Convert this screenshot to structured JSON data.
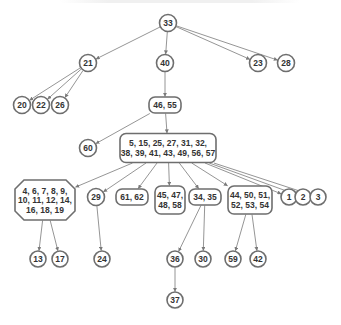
{
  "diagram": {
    "title": "",
    "type": "tree",
    "root": "n33",
    "nodes": [
      {
        "id": "n33",
        "label": [
          "33"
        ],
        "shape": "circle",
        "level": 0
      },
      {
        "id": "n21",
        "label": [
          "21"
        ],
        "shape": "circle",
        "level": 1
      },
      {
        "id": "n40",
        "label": [
          "40"
        ],
        "shape": "circle",
        "level": 1
      },
      {
        "id": "n23",
        "label": [
          "23"
        ],
        "shape": "circle",
        "level": 1
      },
      {
        "id": "n28",
        "label": [
          "28"
        ],
        "shape": "circle",
        "level": 1
      },
      {
        "id": "n20",
        "label": [
          "20"
        ],
        "shape": "circle",
        "level": 2
      },
      {
        "id": "n22",
        "label": [
          "22"
        ],
        "shape": "circle",
        "level": 2
      },
      {
        "id": "n26",
        "label": [
          "26"
        ],
        "shape": "circle",
        "level": 2
      },
      {
        "id": "n46_55",
        "label": [
          "46, 55"
        ],
        "shape": "rounded",
        "level": 2
      },
      {
        "id": "n60",
        "label": [
          "60"
        ],
        "shape": "circle",
        "level": 3
      },
      {
        "id": "nbig",
        "label": [
          "5, 15, 25, 27, 31, 32,",
          "38, 39, 41, 43, 49, 56, 57"
        ],
        "shape": "rounded",
        "level": 3
      },
      {
        "id": "noct",
        "label": [
          "4, 6, 7, 8, 9,",
          "10, 11, 12, 14,",
          "16, 18, 19"
        ],
        "shape": "octagon",
        "level": 4
      },
      {
        "id": "n29",
        "label": [
          "29"
        ],
        "shape": "circle",
        "level": 4
      },
      {
        "id": "n61_62",
        "label": [
          "61, 62"
        ],
        "shape": "rounded",
        "level": 4
      },
      {
        "id": "n45_58",
        "label": [
          "45, 47,",
          "48, 58"
        ],
        "shape": "rounded",
        "level": 4
      },
      {
        "id": "n34_35",
        "label": [
          "34, 35"
        ],
        "shape": "rounded",
        "level": 4
      },
      {
        "id": "n44_54",
        "label": [
          "44, 50, 51,",
          "52, 53, 54"
        ],
        "shape": "rounded",
        "level": 4
      },
      {
        "id": "n1",
        "label": [
          "1"
        ],
        "shape": "circle",
        "level": 4
      },
      {
        "id": "n2",
        "label": [
          "2"
        ],
        "shape": "circle",
        "level": 4
      },
      {
        "id": "n3",
        "label": [
          "3"
        ],
        "shape": "circle",
        "level": 4
      },
      {
        "id": "n13",
        "label": [
          "13"
        ],
        "shape": "circle",
        "level": 5
      },
      {
        "id": "n17",
        "label": [
          "17"
        ],
        "shape": "circle",
        "level": 5
      },
      {
        "id": "n24",
        "label": [
          "24"
        ],
        "shape": "circle",
        "level": 5
      },
      {
        "id": "n36",
        "label": [
          "36"
        ],
        "shape": "circle",
        "level": 5
      },
      {
        "id": "n30",
        "label": [
          "30"
        ],
        "shape": "circle",
        "level": 5
      },
      {
        "id": "n59",
        "label": [
          "59"
        ],
        "shape": "circle",
        "level": 5
      },
      {
        "id": "n42",
        "label": [
          "42"
        ],
        "shape": "circle",
        "level": 5
      },
      {
        "id": "n37",
        "label": [
          "37"
        ],
        "shape": "circle",
        "level": 6
      }
    ],
    "edges": [
      [
        "n33",
        "n21"
      ],
      [
        "n33",
        "n40"
      ],
      [
        "n33",
        "n23"
      ],
      [
        "n33",
        "n28"
      ],
      [
        "n21",
        "n20"
      ],
      [
        "n21",
        "n22"
      ],
      [
        "n21",
        "n26"
      ],
      [
        "n40",
        "n46_55"
      ],
      [
        "n46_55",
        "n60"
      ],
      [
        "n46_55",
        "nbig"
      ],
      [
        "nbig",
        "noct"
      ],
      [
        "nbig",
        "n29"
      ],
      [
        "nbig",
        "n61_62"
      ],
      [
        "nbig",
        "n45_58"
      ],
      [
        "nbig",
        "n34_35"
      ],
      [
        "nbig",
        "n44_54"
      ],
      [
        "nbig",
        "n1"
      ],
      [
        "nbig",
        "n2"
      ],
      [
        "nbig",
        "n3"
      ],
      [
        "noct",
        "n13"
      ],
      [
        "noct",
        "n17"
      ],
      [
        "n29",
        "n24"
      ],
      [
        "n34_35",
        "n36"
      ],
      [
        "n34_35",
        "n30"
      ],
      [
        "n44_54",
        "n59"
      ],
      [
        "n44_54",
        "n42"
      ],
      [
        "n36",
        "n37"
      ]
    ],
    "colors": {
      "node_stroke": "#6e6e6e",
      "edge": "#7a7a7a",
      "text": "#333333",
      "background": "#ffffff"
    }
  }
}
